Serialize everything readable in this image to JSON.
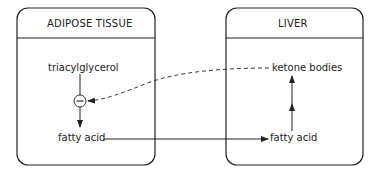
{
  "diagram": {
    "compartments": [
      {
        "id": "adipose",
        "title": "ADIPOSE TISSUE"
      },
      {
        "id": "liver",
        "title": "LIVER"
      }
    ],
    "nodes": {
      "triacylglycerol": "triacylglycerol",
      "fatty_acid_adipose": "fatty acid",
      "fatty_acid_liver": "fatty acid",
      "ketone_bodies": "ketone bodies",
      "inhibition_symbol": "−"
    },
    "edges": [
      {
        "from": "triacylglycerol",
        "to": "fatty_acid_adipose",
        "style": "solid",
        "note": "passes through inhibition point"
      },
      {
        "from": "fatty_acid_adipose",
        "to": "fatty_acid_liver",
        "style": "solid"
      },
      {
        "from": "fatty_acid_liver",
        "to": "ketone_bodies",
        "style": "solid",
        "note": "two stacked arrows"
      },
      {
        "from": "ketone_bodies",
        "to": "inhibition_symbol",
        "style": "dashed",
        "type": "inhibition"
      }
    ],
    "colors": {
      "stroke": "#222222",
      "background": "#ffffff"
    }
  }
}
